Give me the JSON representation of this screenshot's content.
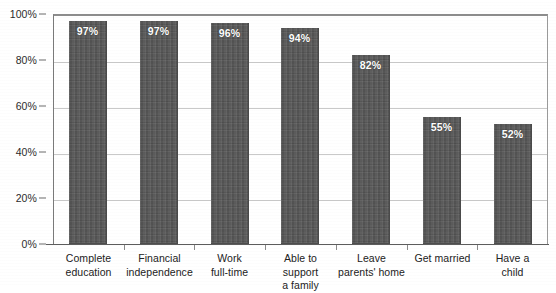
{
  "chart_data": {
    "type": "bar",
    "title": "",
    "subtitle": "",
    "xlabel": "",
    "ylabel": "",
    "ylim": [
      0,
      100
    ],
    "grid": true,
    "legend": "none",
    "orientation": "vertical",
    "bar_color": "#565656",
    "value_label_color": "#ffffff",
    "gridline_color": "#c9c9c9",
    "axis_color": "#5d5d5d",
    "categories": [
      "Complete\neducation",
      "Financial\nindependence",
      "Work\nfull-time",
      "Able to support\na family",
      "Leave\nparents' home",
      "Get married",
      "Have a\nchild"
    ],
    "values": [
      97,
      97,
      96,
      94,
      82,
      55,
      52
    ],
    "value_labels": [
      "97%",
      "97%",
      "96%",
      "94%",
      "82%",
      "55%",
      "52%"
    ],
    "y_ticks": [
      0,
      20,
      40,
      60,
      80,
      100
    ],
    "y_tick_labels": [
      "0%",
      "20%",
      "40%",
      "60%",
      "80%",
      "100%"
    ]
  }
}
